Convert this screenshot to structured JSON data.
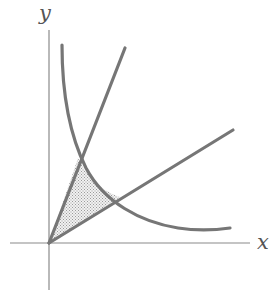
{
  "figure": {
    "background_color": "#ffffff",
    "width": 279,
    "height": 296
  },
  "axes": {
    "x_axis": {
      "label": "x",
      "label_position": {
        "x": 265,
        "y": 245
      },
      "color": "#8a8a8a",
      "stroke_width": 1.2,
      "start": {
        "x": 10,
        "y": 243
      },
      "end": {
        "x": 250,
        "y": 243
      }
    },
    "y_axis": {
      "label": "y",
      "label_position": {
        "x": 48,
        "y": 15
      },
      "color": "#8a8a8a",
      "stroke_width": 1.2,
      "start": {
        "x": 49,
        "y": 30
      },
      "end": {
        "x": 49,
        "y": 290
      }
    },
    "origin": {
      "x": 49,
      "y": 243
    }
  },
  "curves": [
    {
      "name": "steep-line",
      "kind": "line",
      "description": "Upper ray from the origin with steep positive slope",
      "color": "#767676",
      "stroke_width": 3.2,
      "path": "M 49 243 L 125 48"
    },
    {
      "name": "shallow-line",
      "kind": "line",
      "description": "Lower ray from the origin with shallow positive slope",
      "color": "#767676",
      "stroke_width": 3.2,
      "path": "M 49 243 L 233 130"
    },
    {
      "name": "hyperbola",
      "kind": "hyperbola",
      "description": "Decreasing hyperbolic branch crossing both rays",
      "color": "#767676",
      "stroke_width": 3.2,
      "path": "M 62 45 C 62 98, 70 136, 86 168 C 104 202, 140 222, 178 228 C 198 231, 216 230, 230 228"
    }
  ],
  "shaded_region": {
    "name": "shaded-region",
    "description": "Curvilinear triangle between the two rays and the hyperbola arc",
    "fill_color": "#e8e8e8",
    "dot_color": "#9a9a9a",
    "vertices": [
      {
        "name": "origin",
        "x": 49,
        "y": 243
      },
      {
        "name": "upper-intersection",
        "x": 78,
        "y": 158
      },
      {
        "name": "right-intersection",
        "x": 120,
        "y": 197
      }
    ],
    "path": "M 49 243 L 78 158 C 88 178, 100 190, 120 197 Z"
  },
  "intersections": [
    {
      "name": "upper-intersection",
      "description": "Steep ray meets the hyperbola",
      "x": 78,
      "y": 158
    },
    {
      "name": "right-intersection",
      "description": "Shallow ray meets the hyperbola",
      "x": 120,
      "y": 197
    }
  ],
  "colors": {
    "curve": "#767676",
    "axis": "#8a8a8a",
    "label": "#555555",
    "shade_fill": "#e8e8e8",
    "shade_dots": "#9a9a9a",
    "background": "#ffffff"
  }
}
